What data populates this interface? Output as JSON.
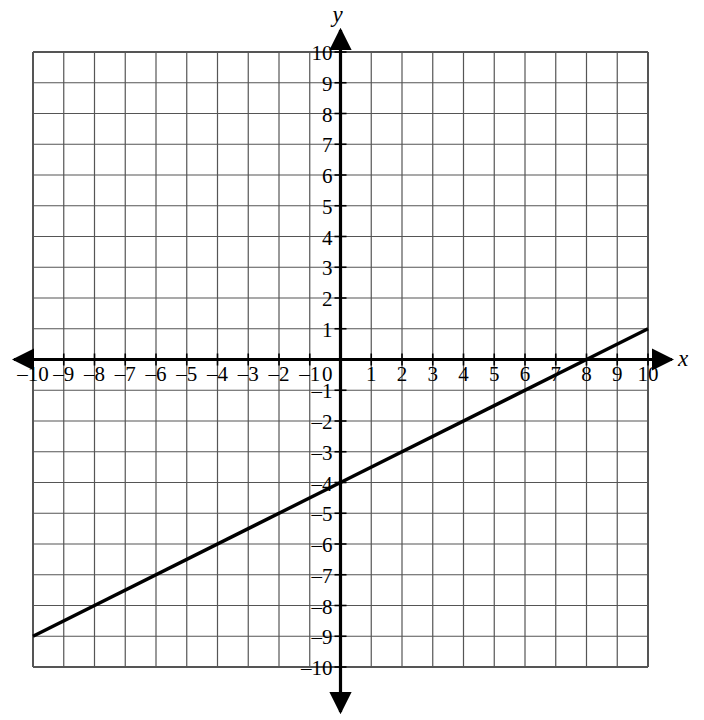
{
  "chart_data": {
    "type": "line",
    "title": "",
    "xlabel": "x",
    "ylabel": "y",
    "xlim": [
      -10,
      10
    ],
    "ylim": [
      -10,
      10
    ],
    "grid": true,
    "grid_step": 1,
    "legend": "none",
    "x_tick_labels": [
      "-10",
      "-9",
      "-8",
      "-7",
      "-6",
      "-5",
      "-4",
      "-3",
      "-2",
      "-1",
      "0",
      "1",
      "2",
      "3",
      "4",
      "5",
      "6",
      "7",
      "8",
      "9",
      "10"
    ],
    "y_tick_labels": [
      "10",
      "9",
      "8",
      "7",
      "6",
      "5",
      "4",
      "3",
      "2",
      "1",
      "-1",
      "-2",
      "-3",
      "-4",
      "-5",
      "-6",
      "-7",
      "-8",
      "-9",
      "-10"
    ],
    "origin_label": "0",
    "series": [
      {
        "name": "line",
        "points": [
          [
            -10,
            -9
          ],
          [
            0,
            -4
          ],
          [
            8,
            0
          ],
          [
            10,
            1
          ]
        ],
        "slope": 0.5,
        "y_intercept": -4,
        "x_intercept": 8,
        "color": "#000000"
      }
    ]
  },
  "figure": {
    "axis_color": "#000000",
    "grid_color": "#555555",
    "background": "#ffffff",
    "x_axis_arrow_left": "arrow-left",
    "x_axis_arrow_right": "arrow-right",
    "y_axis_arrow_up": "arrow-up",
    "y_axis_arrow_down": "arrow-down"
  }
}
